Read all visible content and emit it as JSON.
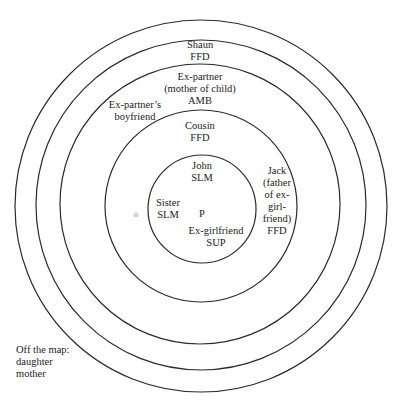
{
  "diagram": {
    "type": "concentric-circle social network map",
    "center_label": "P",
    "rings": [
      {
        "level": 1,
        "members": [
          {
            "name": "John",
            "code": "SLM"
          },
          {
            "name": "Sister",
            "code": "SLM"
          },
          {
            "name": "Ex-girlfriend",
            "code": "SUP"
          }
        ]
      },
      {
        "level": 2,
        "members": [
          {
            "name": "Cousin",
            "code": "FFD"
          },
          {
            "name_lines": [
              "Jack",
              "(father",
              "of ex-",
              "girl-",
              "friend)"
            ],
            "code": "FFD"
          }
        ]
      },
      {
        "level": 3,
        "members": [
          {
            "name_lines": [
              "Ex-partner",
              "(mother of child)"
            ],
            "code": "AMB"
          },
          {
            "name_lines": [
              "Ex-partner’s",
              "boyfriend"
            ],
            "code": ""
          }
        ]
      },
      {
        "level": 4,
        "members": [
          {
            "name": "Shaun",
            "code": "FFD"
          }
        ]
      },
      {
        "level": 5,
        "members": []
      }
    ],
    "off_map": {
      "title": "Off the map:",
      "members": [
        "daughter",
        "mother"
      ]
    }
  }
}
